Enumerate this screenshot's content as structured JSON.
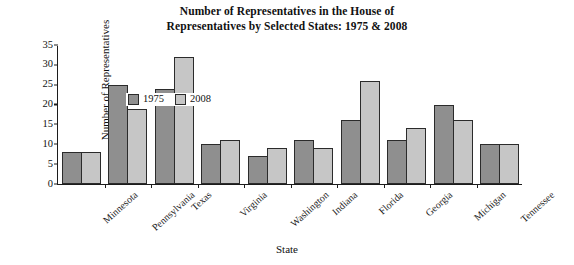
{
  "chart_data": {
    "type": "bar",
    "title": "Number of Representatives in the House of Representatives by Selected States: 1975 & 2008",
    "title_line1": "Number of Representatives in the House of",
    "title_line2": "Representatives by Selected States: 1975 & 2008",
    "xlabel": "State",
    "ylabel": "Number of Representatives",
    "ylim": [
      0,
      35
    ],
    "yticks": [
      0,
      5,
      10,
      15,
      20,
      25,
      30,
      35
    ],
    "grid": false,
    "legend_position": "top-left inside plot",
    "categories": [
      "Minnesota",
      "Pennsylvania",
      "Texas",
      "Virginia",
      "Washington",
      "Indiana",
      "Florida",
      "Georgia",
      "Michigan",
      "Tennessee"
    ],
    "series": [
      {
        "name": "1975",
        "color": "#8f8f8f",
        "values": [
          8,
          25,
          24,
          10,
          7,
          11,
          16,
          11,
          20,
          10
        ]
      },
      {
        "name": "2008",
        "color": "#c6c6c6",
        "values": [
          8,
          19,
          32,
          11,
          9,
          9,
          26,
          14,
          16,
          10
        ]
      }
    ]
  }
}
